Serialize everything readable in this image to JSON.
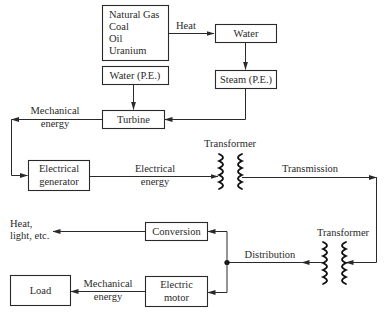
{
  "diagram": {
    "type": "energy-conversion flow diagram",
    "colors": {
      "stroke": "#2a2a2a",
      "background": "#ffffff"
    },
    "nodes": {
      "fuels": {
        "lines": [
          "Natural Gas",
          "Coal",
          "Oil",
          "Uranium"
        ]
      },
      "water": {
        "label": "Water"
      },
      "steam": {
        "label": "Steam (P.E.)"
      },
      "water_pe": {
        "label": "Water (P.E.)"
      },
      "turbine": {
        "label": "Turbine"
      },
      "generator": {
        "lines": [
          "Electrical",
          "generator"
        ]
      },
      "conversion": {
        "label": "Conversion"
      },
      "motor": {
        "lines": [
          "Electric",
          "motor"
        ]
      },
      "load": {
        "label": "Load"
      }
    },
    "edge_labels": {
      "heat": "Heat",
      "mech_energy_1": [
        "Mechanical",
        "energy"
      ],
      "elec_energy": [
        "Electrical",
        "energy"
      ],
      "transmission": "Transmission",
      "distribution": "Distribution",
      "heat_light": [
        "Heat,",
        "light, etc."
      ],
      "mech_energy_2": [
        "Mechanical",
        "energy"
      ]
    },
    "transformers": [
      {
        "label": "Transformer"
      },
      {
        "label": "Transformer"
      }
    ],
    "edges": [
      [
        "fuels",
        "water",
        "Heat"
      ],
      [
        "water",
        "steam"
      ],
      [
        "steam",
        "turbine"
      ],
      [
        "water_pe",
        "turbine"
      ],
      [
        "turbine",
        "generator",
        "Mechanical energy"
      ],
      [
        "generator",
        "transformer_1",
        "Electrical energy"
      ],
      [
        "transformer_1",
        "transformer_2",
        "Transmission"
      ],
      [
        "transformer_2",
        "junction",
        "Distribution"
      ],
      [
        "junction",
        "conversion"
      ],
      [
        "junction",
        "motor"
      ],
      [
        "conversion",
        "heat_light"
      ],
      [
        "motor",
        "load",
        "Mechanical energy"
      ]
    ]
  }
}
